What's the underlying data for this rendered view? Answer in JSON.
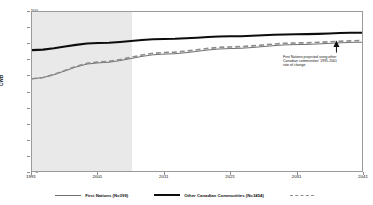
{
  "chart_data": {
    "type": "line",
    "title": "",
    "subtitle": "",
    "xlabel": "",
    "ylabel": "CWB",
    "xlim": [
      1991,
      2041
    ],
    "ylim": [
      0,
      100
    ],
    "grid": false,
    "legend_position": "bottom",
    "x_ticks": [
      "1991",
      "2001",
      "2011",
      "2021",
      "2031",
      "2041"
    ],
    "y_ticks": [
      "0",
      "10",
      "20",
      "30",
      "40",
      "50",
      "60",
      "70",
      "80",
      "90",
      "100"
    ],
    "x": [
      1991,
      2001,
      2011,
      2021,
      2031,
      2041
    ],
    "series": [
      {
        "name": "First Nations (N=399)",
        "style": "thin-solid",
        "color": "#6f6f6f",
        "values": [
          58,
          68,
          73.5,
          77,
          79.5,
          81
        ]
      },
      {
        "name": "Other Canadian Communities (N=3454)",
        "style": "thick-solid",
        "color": "#0d0d0d",
        "values": [
          76,
          80.5,
          83,
          84.7,
          86,
          87
        ]
      },
      {
        "name": "First Nations projected",
        "style": "dashed",
        "color": "#8c8c8c",
        "values": [
          58,
          68.5,
          74.5,
          78,
          80.5,
          82
        ]
      }
    ],
    "shaded_region": {
      "label": "observed",
      "from": 1991,
      "to": 2006,
      "color": "#e9e9e9"
    },
    "annotations": [
      {
        "name": "projection-note",
        "lines": [
          "First Nations projected using other",
          "Canadian communities' 1991-2001",
          "rate of change"
        ],
        "arrow_at_x": 2037,
        "arrow_at_y": 81
      }
    ],
    "colors": {
      "first_nations": "#6f6f6f",
      "other_canadian": "#0d0d0d",
      "projected_dashed": "#8c8c8c",
      "shaded_band": "#e9e9e9",
      "axis": "#9a9a9a",
      "background": "#ffffff"
    }
  },
  "axes": {
    "y_title": "CWB",
    "y_ticks": [
      "100",
      "90",
      "80",
      "70",
      "60",
      "50",
      "40",
      "30",
      "20",
      "10",
      "0"
    ],
    "x_ticks": [
      "1991",
      "2001",
      "2011",
      "2021",
      "2031",
      "2041"
    ]
  },
  "legend": {
    "items": [
      {
        "label": "First Nations (N=399)",
        "style": "thin-solid"
      },
      {
        "label": "Other Canadian Communities (N=3454)",
        "style": "thick-solid"
      },
      {
        "label": "",
        "style": "dashed"
      }
    ]
  },
  "annotation": {
    "line1": "First Nations projected using other",
    "line2": "Canadian communities' 1991-2001",
    "line3": "rate of change"
  }
}
